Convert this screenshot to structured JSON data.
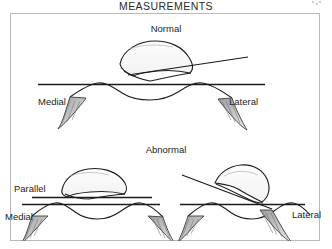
{
  "figure": {
    "title": "MEASUREMENTS",
    "panels": [
      {
        "id": "normal",
        "heading": "Normal",
        "side_labels": {
          "left": "Medial",
          "right": "Lateral"
        },
        "description": "Patella seated on trochlear groove; patellar articular line forms a small open angle with the transcondylar reference line."
      },
      {
        "id": "abnormal",
        "heading": "Abnormal",
        "side_labels": {
          "left": "Medial",
          "right": "Lateral"
        },
        "annotation": "Parallel",
        "description": "Two abnormal cases: left shows patellar line parallel to the transcondylar line; right shows a laterally tilted patella with lines crossing at a wide angle."
      }
    ],
    "labels": {
      "normal": "Normal",
      "abnormal": "Abnormal",
      "medial_top": "Medial",
      "lateral_top": "Lateral",
      "medial_bottom": "Medial",
      "lateral_bottom": "Lateral",
      "parallel": "Parallel"
    },
    "colors": {
      "ink": "#1a1a1a",
      "frame": "#b9b9b9",
      "background": "#ffffff",
      "shading": "#8c8c8c"
    }
  }
}
